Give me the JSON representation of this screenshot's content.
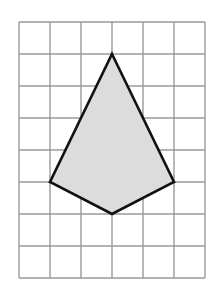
{
  "diagram": {
    "grid": {
      "columns": 6,
      "rows": 8,
      "origin_px": [
        19,
        22
      ],
      "cell_w": 31,
      "cell_h": 32,
      "line_color": "#9a9a9a"
    },
    "shape": {
      "type": "kite",
      "fill": "#dcdcdc",
      "stroke": "#111111",
      "vertices_grid": [
        [
          3,
          1
        ],
        [
          5,
          5
        ],
        [
          3,
          6
        ],
        [
          1,
          5
        ]
      ]
    }
  }
}
